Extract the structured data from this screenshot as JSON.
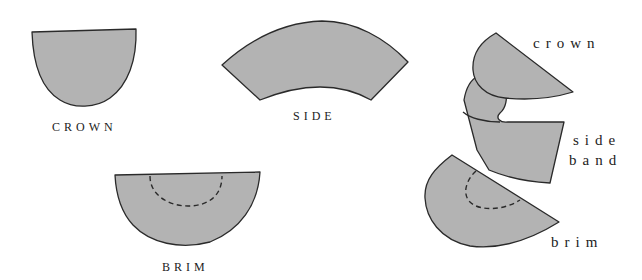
{
  "diagram": {
    "type": "hat-pattern-pieces",
    "colors": {
      "piece_fill": "#b3b3b3",
      "outline": "#2a2a2a",
      "background": "#ffffff"
    },
    "flat_pieces": [
      {
        "id": "crown",
        "label": "CROWN"
      },
      {
        "id": "side",
        "label": "SIDE"
      },
      {
        "id": "brim",
        "label": "BRIM"
      }
    ],
    "assembly": {
      "labels": {
        "crown": "crown",
        "side_line1": "side",
        "side_line2": "band",
        "brim": "brim"
      }
    }
  }
}
